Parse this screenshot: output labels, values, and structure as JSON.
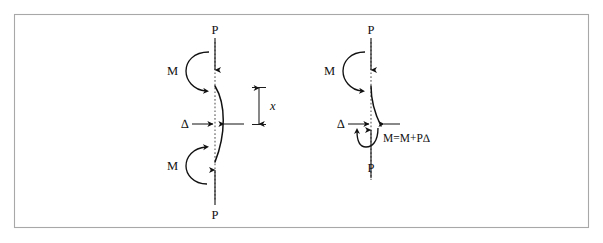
{
  "figure": {
    "background_color": "#ffffff",
    "border_color": "#a8a8a8",
    "line_color": "#111111",
    "centerline_color": "#545454",
    "border": {
      "x": 14,
      "y": 14,
      "width": 575,
      "height": 214
    }
  },
  "diagrams": [
    {
      "id": "pin-pin-column",
      "name": "left-diagram",
      "description": "Column with equal end moments, symmetric bowed deflected shape",
      "labels": {
        "top_load": "P",
        "top_moment": "M",
        "bottom_load": "P",
        "bottom_moment": "M",
        "deflection": "∆",
        "distance": "x"
      }
    },
    {
      "id": "cantilever-column",
      "name": "right-diagram",
      "description": "Column with moment amplified by axial load times deflection",
      "labels": {
        "top_load": "P",
        "top_moment": "M",
        "bottom_load": "P",
        "deflection": "∆",
        "formula": "M=M+P∆"
      }
    }
  ]
}
